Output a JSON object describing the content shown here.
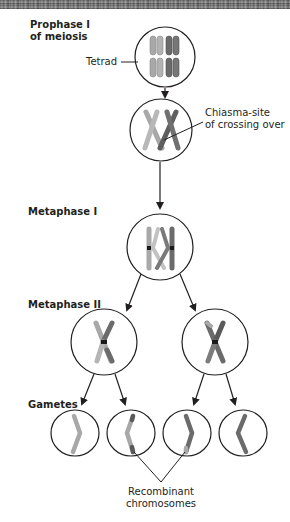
{
  "diagram": {
    "stages": {
      "prophase": [
        "Prophase I",
        "of meiosis"
      ],
      "metaphase1": "Metaphase I",
      "metaphase2": "Metaphase II",
      "gametes": "Gametes"
    },
    "annotations": {
      "tetrad": "Tetrad",
      "chiasma": [
        "Chiasma-site",
        "of crossing over"
      ],
      "recombinant": [
        "Recombinant",
        "chromosomes"
      ]
    },
    "colors": {
      "light_chromosome": "#a8a8a8",
      "light_chromosome_edge": "#8a8a8a",
      "dark_chromosome": "#6b6b6b",
      "dark_chromosome_edge": "#4e4e4e",
      "centromere": "#1a1a1a",
      "outline": "#231f20"
    }
  }
}
